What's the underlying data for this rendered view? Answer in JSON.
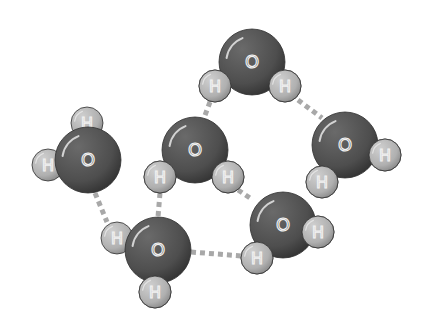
{
  "diagram": {
    "colors": {
      "oxygen": "#555555",
      "oxygen_dark": "#3a3a3a",
      "hydrogen": "#b5b5b5",
      "hydrogen_dark": "#8a8a8a",
      "label": "#f2f2f2",
      "bond": "#a8a8a8",
      "background": "#ffffff"
    },
    "labels": {
      "oxygen": "O",
      "hydrogen": "H"
    },
    "molecules": [
      {
        "id": "water-top",
        "O": [
          252,
          62
        ],
        "H": [
          [
            215,
            86
          ],
          [
            285,
            86
          ]
        ]
      },
      {
        "id": "water-right",
        "O": [
          345,
          145
        ],
        "H": [
          [
            385,
            155
          ],
          [
            322,
            182
          ]
        ]
      },
      {
        "id": "water-center",
        "O": [
          195,
          150
        ],
        "H": [
          [
            160,
            177
          ],
          [
            228,
            177
          ]
        ]
      },
      {
        "id": "water-left",
        "O": [
          88,
          160
        ],
        "H": [
          [
            87,
            123
          ],
          [
            48,
            165
          ]
        ]
      },
      {
        "id": "water-bottom",
        "O": [
          158,
          250
        ],
        "H": [
          [
            117,
            238
          ],
          [
            155,
            292
          ]
        ]
      },
      {
        "id": "water-bottom-right",
        "O": [
          283,
          225
        ],
        "H": [
          [
            318,
            232
          ],
          [
            257,
            258
          ]
        ]
      }
    ],
    "hydrogen_bonds": [
      {
        "from": [
          298,
          100
        ],
        "to": [
          322,
          118
        ]
      },
      {
        "from": [
          210,
          102
        ],
        "to": [
          204,
          118
        ]
      },
      {
        "from": [
          95,
          193
        ],
        "to": [
          107,
          222
        ]
      },
      {
        "from": [
          160,
          193
        ],
        "to": [
          158,
          217
        ]
      },
      {
        "from": [
          238,
          190
        ],
        "to": [
          253,
          200
        ]
      },
      {
        "from": [
          191,
          252
        ],
        "to": [
          242,
          256
        ]
      }
    ]
  }
}
